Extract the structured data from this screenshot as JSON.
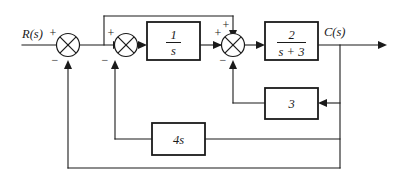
{
  "diagram": {
    "input_label": "R(s)",
    "output_label": "C(s)",
    "line_color": "#1a1a1a",
    "background": "#ffffff",
    "blocks": [
      {
        "id": "integrator",
        "numerator": "1",
        "denominator": "s",
        "is_fraction": true
      },
      {
        "id": "plant",
        "numerator": "2",
        "denominator": "s + 3",
        "is_fraction": true
      },
      {
        "id": "inner-gain",
        "label": "3",
        "is_fraction": false
      },
      {
        "id": "rate-gain",
        "label": "4s",
        "is_fraction": false
      }
    ],
    "summing_junctions": [
      {
        "id": "sum1",
        "signs": {
          "left": "+",
          "bottom": "−"
        }
      },
      {
        "id": "sum2",
        "signs": {
          "left": "+",
          "bottom": "−"
        }
      },
      {
        "id": "sum3",
        "signs": {
          "left": "+",
          "top": "+",
          "bottom": "−"
        }
      }
    ]
  }
}
